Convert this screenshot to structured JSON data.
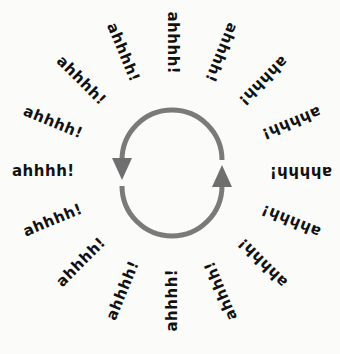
{
  "diagram": {
    "title": "",
    "center": {
      "x": 172,
      "y": 172
    },
    "cycle": {
      "color": "#7a7a7a",
      "radius": 50,
      "arrow_left": "down",
      "arrow_right": "up"
    },
    "word_color": "#111111",
    "words": [
      "ahhhh!",
      "ahhhh!",
      "ahhhh!",
      "ahhhh!",
      "ahhhh!",
      "ahhhh!",
      "ahhhh!",
      "ahhhh!",
      "ahhhh!",
      "ahhhh!",
      "ahhhh!",
      "ahhhh!",
      "ahhhh!",
      "ahhhh!",
      "ahhhh!",
      "ahhhh!"
    ]
  }
}
